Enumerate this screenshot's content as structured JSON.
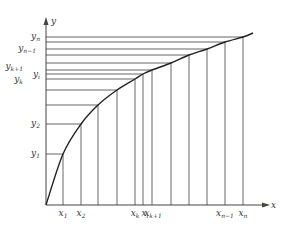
{
  "diagram": {
    "colors": {
      "background": "#ffffff",
      "line": "#555555",
      "curve": "#222222",
      "text": "#333333"
    },
    "axes": {
      "x_label": "x",
      "y_label": "y"
    },
    "y_labels": [
      {
        "base": "y",
        "sub": "n",
        "y": 37,
        "x": 40
      },
      {
        "base": "y",
        "sub": "n−1",
        "y": 49,
        "x": 36
      },
      {
        "base": "y",
        "sub": "k+1",
        "y": 67,
        "x": 23
      },
      {
        "base": "y",
        "sub": "k",
        "y": 80,
        "x": 23
      },
      {
        "base": "y",
        "sub": "i",
        "y": 75,
        "x": 40
      },
      {
        "base": "y",
        "sub": "2",
        "y": 124,
        "x": 40
      },
      {
        "base": "y",
        "sub": "1",
        "y": 154,
        "x": 40
      }
    ],
    "x_labels": [
      {
        "base": "x",
        "sub": "1",
        "x": 63
      },
      {
        "base": "x",
        "sub": "2",
        "x": 81
      },
      {
        "base": "x",
        "sub": "k",
        "x": 135
      },
      {
        "base": "x",
        "sub": "i",
        "x": 145
      },
      {
        "base": "x",
        "sub": "k+1",
        "x": 153
      },
      {
        "base": "x",
        "sub": "n−1",
        "x": 225
      },
      {
        "base": "x",
        "sub": "n",
        "x": 243
      }
    ],
    "curve_points": [
      [
        46,
        205
      ],
      [
        63,
        154
      ],
      [
        81,
        124
      ],
      [
        98,
        105
      ],
      [
        117,
        90
      ],
      [
        135,
        79
      ],
      [
        143,
        74
      ],
      [
        152,
        70
      ],
      [
        171,
        63
      ],
      [
        189,
        55
      ],
      [
        207,
        49
      ],
      [
        225,
        42
      ],
      [
        243,
        37
      ],
      [
        253,
        33
      ]
    ]
  }
}
